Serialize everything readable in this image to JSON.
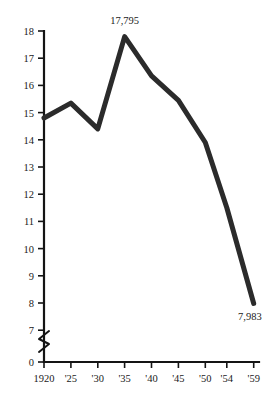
{
  "chart_data": {
    "type": "line",
    "title": "",
    "subtitle": "",
    "xlabel": "",
    "ylabel": "",
    "x": [
      1920,
      1925,
      1930,
      1935,
      1940,
      1945,
      1950,
      1954,
      1959
    ],
    "categories": [
      "1920",
      "'25",
      "'30",
      "'35",
      "'40",
      "'45",
      "'50",
      "'54",
      "'59"
    ],
    "values": [
      14.8,
      15.35,
      14.4,
      17.795,
      16.35,
      15.45,
      13.9,
      11.5,
      7.983
    ],
    "series": [
      {
        "name": "",
        "values": [
          14.8,
          15.35,
          14.4,
          17.795,
          16.35,
          15.45,
          13.9,
          11.5,
          7.983
        ]
      }
    ],
    "ylim": [
      7,
      18
    ],
    "xlim": [
      1920,
      1959
    ],
    "yticks": [
      0,
      7,
      8,
      9,
      10,
      11,
      12,
      13,
      14,
      15,
      16,
      17,
      18
    ],
    "ytick_labels": [
      "0",
      "7",
      "8",
      "9",
      "10",
      "11",
      "12",
      "13",
      "14",
      "15",
      "16",
      "17",
      "18"
    ],
    "xtick_labels": [
      "1920",
      "'25",
      "'30",
      "'35",
      "'40",
      "'45",
      "'50",
      "'54",
      "'59"
    ],
    "grid": false,
    "legend": false,
    "legend_position": "none",
    "axis_break": true,
    "axis_break_note": "y-axis broken between 0 and 7",
    "line_color": "#2b2b2b",
    "line_width": 5,
    "axis_color": "#141414",
    "background_color": "#ffffff",
    "annotations": [
      {
        "label": "17,795",
        "x": 1935,
        "y": 17.795,
        "position": "above"
      },
      {
        "label": "7,983",
        "x": 1959,
        "y": 7.983,
        "position": "below-left"
      }
    ]
  },
  "labels": {
    "peak_value": "17,795",
    "end_value": "7,983",
    "y_0": "0",
    "y_7": "7",
    "y_8": "8",
    "y_9": "9",
    "y_10": "10",
    "y_11": "11",
    "y_12": "12",
    "y_13": "13",
    "y_14": "14",
    "y_15": "15",
    "y_16": "16",
    "y_17": "17",
    "y_18": "18",
    "x_1920": "1920",
    "x_25": "'25",
    "x_30": "'30",
    "x_35": "'35",
    "x_40": "'40",
    "x_45": "'45",
    "x_50": "'50",
    "x_54": "'54",
    "x_59": "'59"
  }
}
